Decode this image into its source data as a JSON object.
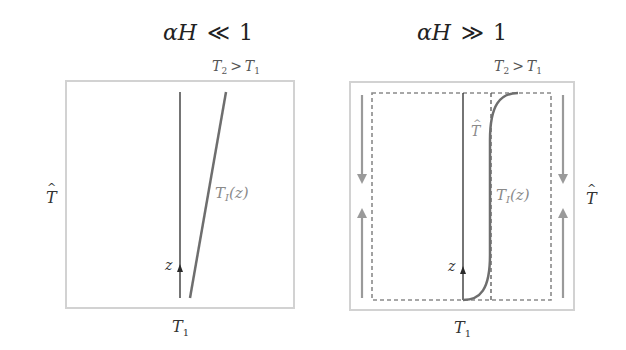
{
  "colors": {
    "box_border": "#d2d2d2",
    "axis_line": "#2a2a2a",
    "profile_line": "#6e6e6e",
    "dashed": "#8a8a8a",
    "flow_arrow": "#9a9a9a",
    "label_dark": "#222222",
    "label_gray": "#8a8a8a"
  },
  "left_panel": {
    "title_a": "αH",
    "title_rel": "≪",
    "title_b": "1",
    "top_label_T": "T",
    "top_label_sub2": "2",
    "top_label_rel": ">",
    "top_label_T1": "T",
    "top_label_sub1": "1",
    "side_label": "T",
    "side_label_hat": "^",
    "profile_label_T": "T",
    "profile_label_sub": "I",
    "profile_label_arg": "(z)",
    "axis_label": "z",
    "bottom_label_T": "T",
    "bottom_label_sub": "1"
  },
  "right_panel": {
    "title_a": "αH",
    "title_rel": "≫",
    "title_b": "1",
    "top_label_T": "T",
    "top_label_sub2": "2",
    "top_label_rel": ">",
    "top_label_T1": "T",
    "top_label_sub1": "1",
    "inner_label": "T",
    "inner_label_hat": "^",
    "side_label": "T",
    "side_label_hat": "^",
    "profile_label_T": "T",
    "profile_label_sub": "I",
    "profile_label_arg": "(z)",
    "axis_label": "z",
    "bottom_label_T": "T",
    "bottom_label_sub": "1"
  }
}
